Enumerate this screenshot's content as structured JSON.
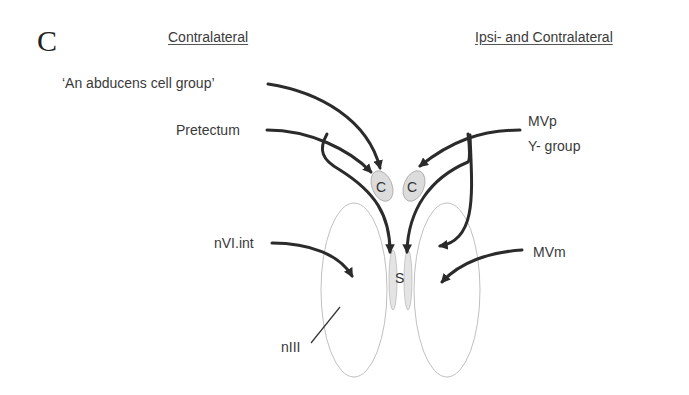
{
  "panel_label": "C",
  "headers": {
    "left": "Contralateral",
    "right": "Ipsi- and Contralateral"
  },
  "inputs": {
    "abducens": "‘An abducens cell group’",
    "pretectum": "Pretectum",
    "mvp": "MVp",
    "ygroup": "Y- group",
    "nvi_int": "nVI.int",
    "mvm": "MVm",
    "niii": "nIII"
  },
  "nodes": {
    "c_left": "C",
    "c_right": "C",
    "s": "S"
  },
  "colors": {
    "arrow": "#2b2b2b",
    "nucleus_outline": "#b8b8b8",
    "subnucleus_fill": "#dedede",
    "text": "#3a3a3a"
  }
}
